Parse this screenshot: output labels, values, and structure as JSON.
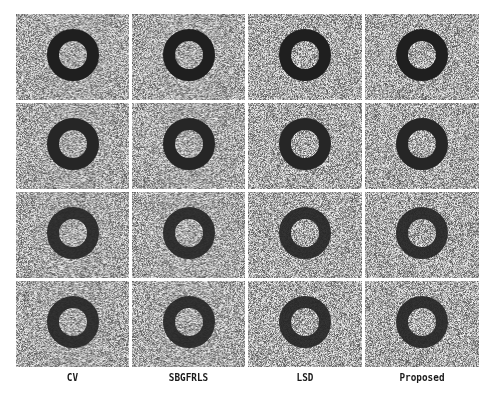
{
  "figure": {
    "columns": [
      {
        "label": "CV"
      },
      {
        "label": "SBGFRLS"
      },
      {
        "label": "LSD"
      },
      {
        "label": "Proposed"
      }
    ],
    "rows": 4,
    "panel_content": "noisy gray image with dark ring object",
    "colors": {
      "background_noise": "#a9a9a9",
      "ring": "#1f1f1f",
      "grid_gap": "#ffffff"
    }
  }
}
